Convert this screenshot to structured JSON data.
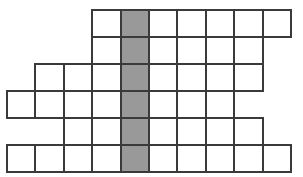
{
  "figure": {
    "name": "staircase-grid-puzzle",
    "type": "grid-polyomino",
    "background_color": "#ffffff",
    "cell_fill_color": "#ffffff",
    "cell_border_color": "#3a3a3a",
    "shaded_fill_color": "#999999",
    "border_width_px": 2,
    "origin_x_px": 6,
    "origin_y_px": 9,
    "cell_width_px": 28.4,
    "cell_height_px": 27,
    "column_count": 10,
    "row_count": 6,
    "shaded_column_index": 4,
    "rows": [
      {
        "row_index": 0,
        "name": "row-1",
        "start_column": 3,
        "end_column": 9,
        "cell_count": 7,
        "shaded_columns": [
          4
        ]
      },
      {
        "row_index": 1,
        "name": "row-2",
        "start_column": 3,
        "end_column": 8,
        "cell_count": 6,
        "shaded_columns": [
          4
        ]
      },
      {
        "row_index": 2,
        "name": "row-3",
        "start_column": 1,
        "end_column": 8,
        "cell_count": 8,
        "shaded_columns": [
          4
        ]
      },
      {
        "row_index": 3,
        "name": "row-4",
        "start_column": 0,
        "end_column": 7,
        "cell_count": 8,
        "shaded_columns": [
          4
        ]
      },
      {
        "row_index": 4,
        "name": "row-5",
        "start_column": 2,
        "end_column": 8,
        "cell_count": 7,
        "shaded_columns": [
          4
        ]
      },
      {
        "row_index": 5,
        "name": "row-6",
        "start_column": 0,
        "end_column": 9,
        "cell_count": 10,
        "shaded_columns": [
          4
        ]
      }
    ]
  }
}
